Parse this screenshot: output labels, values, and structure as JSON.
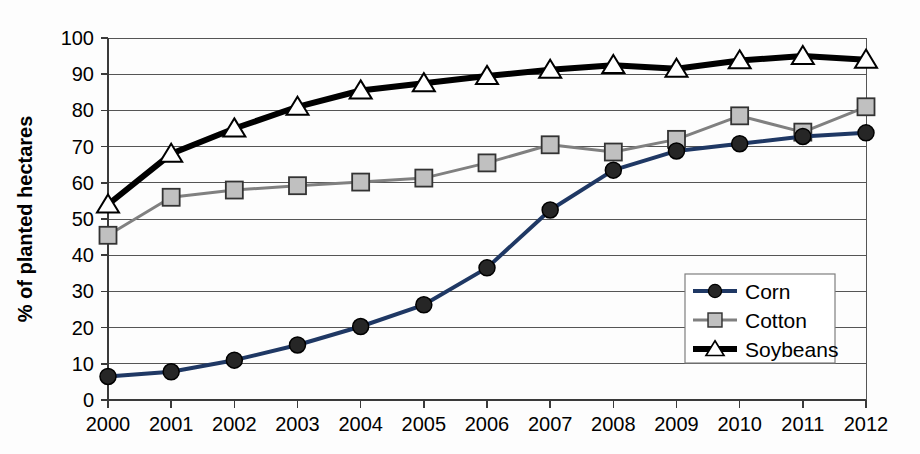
{
  "chart_data": {
    "type": "line",
    "title": "",
    "subtitle": "",
    "xlabel": "",
    "ylabel": "% of planted hectares",
    "categories": [
      "2000",
      "2001",
      "2002",
      "2003",
      "2004",
      "2005",
      "2006",
      "2007",
      "2008",
      "2009",
      "2010",
      "2011",
      "2012"
    ],
    "ylim": [
      0,
      100
    ],
    "yticks": [
      0,
      10,
      20,
      30,
      40,
      50,
      60,
      70,
      80,
      90,
      100
    ],
    "ytick_labels": [
      "0",
      "10",
      "20",
      "30",
      "40",
      "50",
      "60",
      "70",
      "80",
      "90",
      "100"
    ],
    "grid": true,
    "grid_axis": "y",
    "legend_position": "bottom-right-inside",
    "series": [
      {
        "name": "Corn",
        "color": "#1f3864",
        "marker": "circle",
        "marker_fill": "#262626",
        "marker_stroke": "#000000",
        "line_width": 4,
        "values": [
          6.5,
          7.8,
          11.0,
          15.2,
          20.3,
          26.3,
          36.5,
          52.5,
          63.5,
          68.8,
          70.8,
          72.8,
          73.8
        ]
      },
      {
        "name": "Cotton",
        "color": "#808080",
        "marker": "square",
        "marker_fill": "#c0c0c0",
        "marker_stroke": "#333333",
        "line_width": 3,
        "values": [
          45.5,
          56.0,
          58.0,
          59.2,
          60.2,
          61.3,
          65.5,
          70.5,
          68.5,
          72.0,
          78.5,
          74.0,
          81.0
        ]
      },
      {
        "name": "Soybeans",
        "color": "#000000",
        "marker": "triangle",
        "marker_fill": "#ffffff",
        "marker_stroke": "#000000",
        "line_width": 6,
        "values": [
          54.0,
          68.0,
          75.0,
          81.0,
          85.5,
          87.5,
          89.5,
          91.2,
          92.5,
          91.5,
          93.8,
          95.0,
          94.0
        ]
      }
    ]
  },
  "legend": {
    "items": [
      {
        "label": "Corn"
      },
      {
        "label": "Cotton"
      },
      {
        "label": "Soybeans"
      }
    ]
  },
  "axes": {
    "y_title": "% of planted hectares"
  }
}
